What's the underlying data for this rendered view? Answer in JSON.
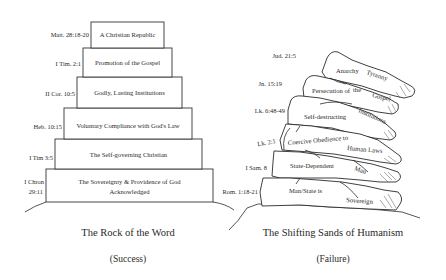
{
  "left_diagram": {
    "title": "The Rock of the Word",
    "subtitle": "(Success)",
    "tiers": [
      {
        "label": "A Christian Republic",
        "ref": "Matt. 28:18-20"
      },
      {
        "label": "Promotion of the Gospel",
        "ref": "I Tim. 2:1"
      },
      {
        "label": "Godly, Lasting Institutions",
        "ref": "II Cor. 10:5"
      },
      {
        "label": "Voluntary Compliance with God's Law",
        "ref": "Heb. 10:15"
      },
      {
        "label": "The Self-governing Christian",
        "ref": "I Tim 3:5"
      },
      {
        "label_line1": "The Sovereignty & Providence of God",
        "label_line2": "Acknowledged",
        "ref_line1": "I Chron",
        "ref_line2": "29:11"
      }
    ]
  },
  "right_diagram": {
    "title": "The Shifting Sands of Humanism",
    "subtitle": "(Failure)",
    "rocks": [
      {
        "label_a": "Anarchy",
        "label_b": "Tyranny",
        "ref": "Jud. 21:5"
      },
      {
        "label_a": "Persecution of",
        "label_b": "the",
        "label_c": "Gospel",
        "ref": "Jn. 15:19"
      },
      {
        "label_a": "Self-destructing",
        "label_b": "Institutions",
        "ref": "Lk. 6:48-49"
      },
      {
        "label_a": "Coercive Obedience to",
        "label_b": "Human Laws",
        "ref": "Lk. 2:1"
      },
      {
        "label_a": "State-Dependent",
        "label_b": "Man",
        "ref": "I Sam. 8"
      },
      {
        "label_a": "Man/State is",
        "label_b": "Sovereign",
        "ref": "Rom. 1:18-21"
      }
    ]
  }
}
